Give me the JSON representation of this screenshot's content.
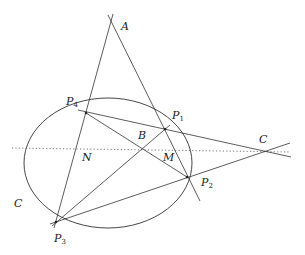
{
  "diagram": {
    "type": "projective-geometry-ellipse-quadrilateral",
    "colors": {
      "line": "#333333",
      "dotted": "#555555",
      "background": "#ffffff"
    },
    "curve": {
      "name": "C",
      "label": "C",
      "cx": 108,
      "cy": 163,
      "rx": 84,
      "ry": 65
    },
    "points": {
      "A": {
        "label": "A",
        "x": 111,
        "y": 20
      },
      "P1": {
        "label": "P",
        "sub": "1",
        "x": 165,
        "y": 129
      },
      "P2": {
        "label": "P",
        "sub": "2",
        "x": 187,
        "y": 177
      },
      "P3": {
        "label": "P",
        "sub": "3",
        "x": 56,
        "y": 222
      },
      "P4": {
        "label": "P",
        "sub": "4",
        "x": 86,
        "y": 113
      },
      "B": {
        "label": "B",
        "x": 143,
        "y": 150
      },
      "C": {
        "label": "C",
        "x": 263,
        "y": 151
      },
      "M": {
        "label": "M"
      },
      "N": {
        "label": "N"
      }
    },
    "lines": [
      "A-P3",
      "A-P2",
      "P4-C",
      "P3-C",
      "P4-P2",
      "P3-P1"
    ],
    "dotted_line": {
      "label": "polar line through B and C"
    }
  }
}
